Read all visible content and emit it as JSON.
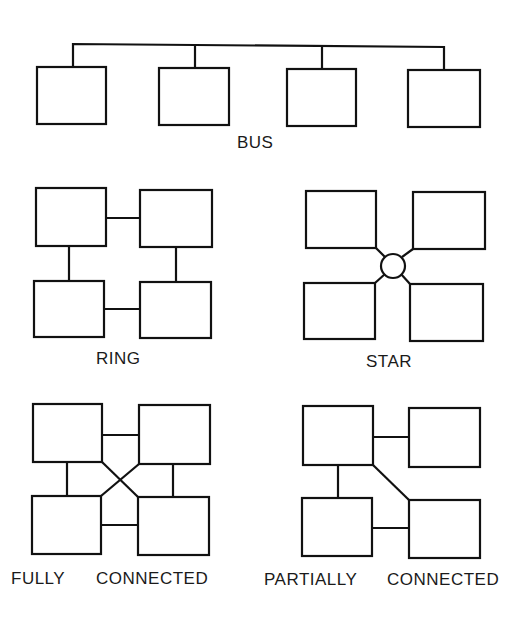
{
  "diagram": {
    "colors": {
      "line": "#111111",
      "background": "#ffffff",
      "text": "#1a1a1a"
    },
    "topologies": {
      "bus": {
        "label": "BUS",
        "nodes": 4,
        "links": [
          "bus-backbone"
        ]
      },
      "ring": {
        "label": "RING",
        "nodes": 4,
        "links": [
          "n1-n2",
          "n2-n4",
          "n4-n3",
          "n3-n1"
        ]
      },
      "star": {
        "label": "STAR",
        "nodes": 4,
        "hub": "central-hub",
        "links": [
          "n1-hub",
          "n2-hub",
          "n3-hub",
          "n4-hub"
        ]
      },
      "fully_connected": {
        "label_word1": "FULLY",
        "label_word2": "CONNECTED",
        "nodes": 4,
        "links": [
          "n1-n2",
          "n1-n3",
          "n1-n4",
          "n2-n3",
          "n2-n4",
          "n3-n4"
        ]
      },
      "partially_connected": {
        "label_word1": "PARTIALLY",
        "label_word2": "CONNECTED",
        "nodes": 4,
        "links": [
          "n1-n2",
          "n1-n3",
          "n1-n4",
          "n3-n4"
        ]
      }
    }
  }
}
